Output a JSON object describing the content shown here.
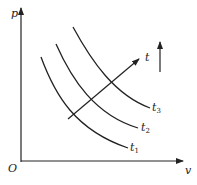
{
  "axes": {
    "y_label": "p",
    "x_label": "v",
    "origin_label": "O"
  },
  "curves": [
    {
      "name": "t",
      "sub": "1"
    },
    {
      "name": "t",
      "sub": "2"
    },
    {
      "name": "t",
      "sub": "3"
    }
  ],
  "arrow_label": "t",
  "colors": {
    "line": "#222222",
    "background": "#ffffff"
  }
}
